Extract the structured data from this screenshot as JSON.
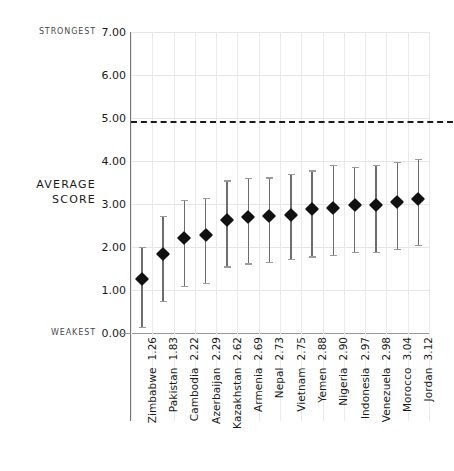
{
  "axis": {
    "title_line1": "AVERAGE",
    "title_line2": "SCORE",
    "strongest_label": "STRONGEST",
    "weakest_label": "WEAKEST",
    "yticks": [
      "0.00",
      "1.00",
      "2.00",
      "3.00",
      "4.00",
      "5.00",
      "6.00",
      "7.00"
    ]
  },
  "colors": {
    "marker": "#111111",
    "errorbar": "#6d6d6d",
    "grid": "#e6e6e6",
    "axis": "#777777",
    "threshold": "#1a1a1a"
  },
  "chart_data": {
    "type": "scatter",
    "title": "",
    "subtitle": "",
    "xlabel": "",
    "ylabel": "AVERAGE SCORE",
    "ylim": [
      0.0,
      7.0
    ],
    "ytick_values": [
      0.0,
      1.0,
      2.0,
      3.0,
      4.0,
      5.0,
      6.0,
      7.0
    ],
    "ytick_labels": [
      "0.00",
      "1.00",
      "2.00",
      "3.00",
      "4.00",
      "5.00",
      "6.00",
      "7.00"
    ],
    "y_axis_top_annotation": "STRONGEST",
    "y_axis_bottom_annotation": "WEAKEST",
    "grid": true,
    "legend": "none",
    "error_bars": true,
    "annotations": [
      {
        "type": "hline",
        "value": 4.92,
        "style": "dashed",
        "label": ""
      }
    ],
    "categories": [
      "Zimbabwe",
      "Pakistan",
      "Cambodia",
      "Azerbaijan",
      "Kazakhstan",
      "Armenia",
      "Nepal",
      "Vietnam",
      "Yemen",
      "Nigeria",
      "Indonesia",
      "Venezuela",
      "Morocco",
      "Jordan"
    ],
    "values": [
      1.26,
      1.83,
      2.22,
      2.29,
      2.62,
      2.69,
      2.73,
      2.75,
      2.88,
      2.9,
      2.97,
      2.98,
      3.04,
      3.12
    ],
    "value_labels": [
      "1.26",
      "1.83",
      "2.22",
      "2.29",
      "2.62",
      "2.69",
      "2.73",
      "2.75",
      "2.88",
      "2.90",
      "2.97",
      "2.98",
      "3.04",
      "3.12"
    ],
    "error_low": [
      0.15,
      0.75,
      1.1,
      1.17,
      1.55,
      1.62,
      1.65,
      1.73,
      1.78,
      1.81,
      1.88,
      1.89,
      1.96,
      2.05
    ],
    "error_high": [
      2.0,
      2.72,
      3.09,
      3.15,
      3.55,
      3.6,
      3.62,
      3.7,
      3.78,
      3.9,
      3.86,
      3.9,
      3.97,
      4.05
    ],
    "points": [
      {
        "category": "Zimbabwe",
        "value": 1.26,
        "low": 0.15,
        "high": 2.0
      },
      {
        "category": "Pakistan",
        "value": 1.83,
        "low": 0.75,
        "high": 2.72
      },
      {
        "category": "Cambodia",
        "value": 2.22,
        "low": 1.1,
        "high": 3.09
      },
      {
        "category": "Azerbaijan",
        "value": 2.29,
        "low": 1.17,
        "high": 3.15
      },
      {
        "category": "Kazakhstan",
        "value": 2.62,
        "low": 1.55,
        "high": 3.55
      },
      {
        "category": "Armenia",
        "value": 2.69,
        "low": 1.62,
        "high": 3.6
      },
      {
        "category": "Nepal",
        "value": 2.73,
        "low": 1.65,
        "high": 3.62
      },
      {
        "category": "Vietnam",
        "value": 2.75,
        "low": 1.73,
        "high": 3.7
      },
      {
        "category": "Yemen",
        "value": 2.88,
        "low": 1.78,
        "high": 3.78
      },
      {
        "category": "Nigeria",
        "value": 2.9,
        "low": 1.81,
        "high": 3.9
      },
      {
        "category": "Indonesia",
        "value": 2.97,
        "low": 1.88,
        "high": 3.86
      },
      {
        "category": "Venezuela",
        "value": 2.98,
        "low": 1.89,
        "high": 3.9
      },
      {
        "category": "Morocco",
        "value": 3.04,
        "low": 1.96,
        "high": 3.97
      },
      {
        "category": "Jordan",
        "value": 3.12,
        "low": 2.05,
        "high": 4.05
      }
    ]
  }
}
